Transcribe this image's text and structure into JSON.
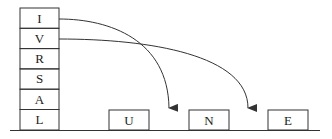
{
  "stack": {
    "letters": [
      "I",
      "V",
      "R",
      "S",
      "A",
      "L"
    ]
  },
  "ground_boxes": {
    "letters": [
      "U",
      "N",
      "E"
    ]
  },
  "arrows": [
    {
      "from": "I",
      "to_gap": "between U and N"
    },
    {
      "from": "V",
      "to_gap": "between N and E"
    }
  ],
  "colors": {
    "stroke": "#333333",
    "background": "#ffffff"
  }
}
